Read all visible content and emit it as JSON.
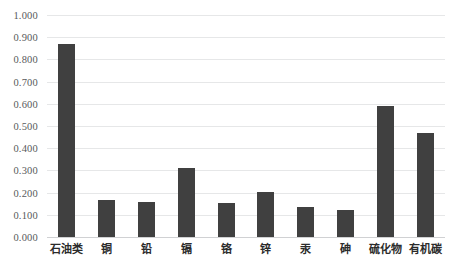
{
  "chart_data": {
    "type": "bar",
    "title": "",
    "subtitle": "",
    "xlabel": "",
    "ylabel": "",
    "ylim": [
      0.0,
      1.0
    ],
    "ytick_labels": [
      "1.000",
      "0.900",
      "0.800",
      "0.700",
      "0.600",
      "0.500",
      "0.400",
      "0.300",
      "0.200",
      "0.100",
      "0.000"
    ],
    "ytick_values": [
      1.0,
      0.9,
      0.8,
      0.7,
      0.6,
      0.5,
      0.4,
      0.3,
      0.2,
      0.1,
      0.0
    ],
    "grid": true,
    "legend": false,
    "legend_position": "none",
    "bar_color": "#404040",
    "gridline_color": "#E6E7E8",
    "categories": [
      "石油类",
      "铜",
      "铅",
      "镉",
      "铬",
      "锌",
      "汞",
      "砷",
      "硫化物",
      "有机碳"
    ],
    "values": [
      0.868,
      0.168,
      0.157,
      0.312,
      0.152,
      0.205,
      0.135,
      0.122,
      0.588,
      0.468
    ],
    "series": [
      {
        "name": "",
        "values": [
          0.868,
          0.168,
          0.157,
          0.312,
          0.152,
          0.205,
          0.135,
          0.122,
          0.588,
          0.468
        ]
      }
    ]
  }
}
